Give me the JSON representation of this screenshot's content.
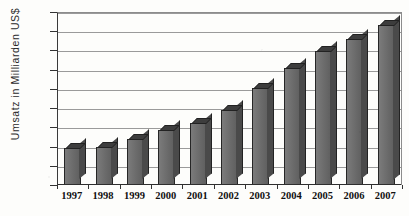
{
  "chart_data": {
    "type": "bar",
    "title": "",
    "xlabel": "",
    "ylabel": "Umsatz in Milliarden US$",
    "categories": [
      "1997",
      "1998",
      "1999",
      "2000",
      "2001",
      "2002",
      "2003",
      "2004",
      "2005",
      "2006",
      "2007"
    ],
    "values": [
      38,
      40,
      48,
      57,
      65,
      78,
      101,
      122,
      139,
      152,
      167
    ],
    "ylim": [
      0,
      180
    ],
    "yticks": [
      0,
      20,
      40,
      60,
      80,
      100,
      120,
      140,
      160,
      180
    ],
    "ytick_labels": [
      "0",
      "20",
      "40",
      "60",
      "80",
      "100",
      "120",
      "140",
      "160",
      "180"
    ],
    "grid": true,
    "legend": false,
    "series": [
      {
        "name": "Umsatz",
        "values": [
          38,
          40,
          48,
          57,
          65,
          78,
          101,
          122,
          139,
          152,
          167
        ],
        "color": "#6f6f6f"
      }
    ],
    "style": {
      "bar_face": "#6f6f6f",
      "bar_side": "#4a4a4a",
      "bar_top": "#3d3d3d",
      "bar_outline": "#262626",
      "gridline": "#9a9a9a",
      "axis": "#2e2e2e",
      "background": "#fdfdfb",
      "three_d": true
    }
  }
}
